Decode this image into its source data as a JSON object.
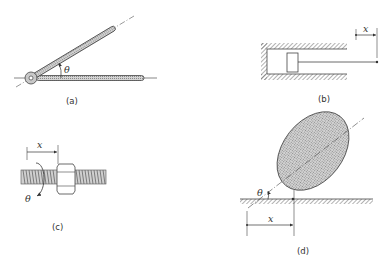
{
  "figure": {
    "panels": [
      {
        "id": "a",
        "caption": "(a)",
        "description": "Two hinged bars at a pivot, angle between them",
        "variables": {
          "angle": "θ"
        }
      },
      {
        "id": "b",
        "caption": "(b)",
        "description": "Piston in cylinder with rod, linear displacement",
        "variables": {
          "displacement": "x"
        }
      },
      {
        "id": "c",
        "caption": "(c)",
        "description": "Threaded screw with nut, linear and rotational displacement",
        "variables": {
          "displacement": "x",
          "rotation": "θ"
        }
      },
      {
        "id": "d",
        "caption": "(d)",
        "description": "Elliptical body rolling on ground, displacement and angle",
        "variables": {
          "displacement": "x",
          "angle": "θ"
        }
      }
    ]
  },
  "colors": {
    "ink": "#444444",
    "fill_shade": "#bdbdbd",
    "background": "#ffffff"
  }
}
